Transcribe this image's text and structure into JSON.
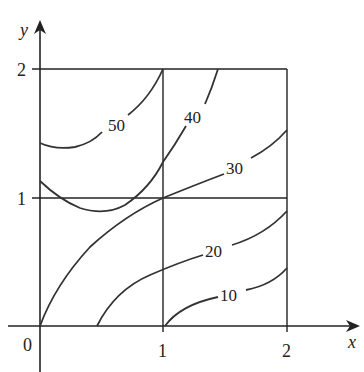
{
  "figure": {
    "type": "contour_map",
    "axes": {
      "x_label": "x",
      "y_label": "y",
      "origin_label": "0",
      "x_ticks": [
        "1",
        "2"
      ],
      "y_ticks": [
        "1",
        "2"
      ]
    },
    "grid_square": {
      "x": [
        0,
        2
      ],
      "y": [
        0,
        2
      ],
      "dividers": {
        "x": 1,
        "y": 1
      }
    },
    "contours": [
      {
        "level": "50",
        "label": "50"
      },
      {
        "level": "40",
        "label": "40"
      },
      {
        "level": "30",
        "label": "30"
      },
      {
        "level": "20",
        "label": "20"
      },
      {
        "level": "10",
        "label": "10"
      }
    ]
  }
}
